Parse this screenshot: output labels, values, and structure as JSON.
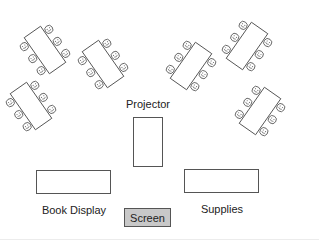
{
  "colors": {
    "stroke": "#555555",
    "screen_fill": "#c8c8c8",
    "background": "#ffffff",
    "text": "#222222"
  },
  "tables": [
    {
      "id": "table-1",
      "cx": 45,
      "cy": 50,
      "w": 20,
      "h": 44,
      "angle": -35,
      "seats_per_side": 3,
      "seats_total": 6
    },
    {
      "id": "table-2",
      "cx": 103,
      "cy": 64,
      "w": 20,
      "h": 44,
      "angle": -35,
      "seats_per_side": 3,
      "seats_total": 6
    },
    {
      "id": "table-3",
      "cx": 31,
      "cy": 106,
      "w": 20,
      "h": 44,
      "angle": -35,
      "seats_per_side": 3,
      "seats_total": 6
    },
    {
      "id": "table-4",
      "cx": 191,
      "cy": 66,
      "w": 20,
      "h": 44,
      "angle": 35,
      "seats_per_side": 3,
      "seats_total": 6
    },
    {
      "id": "table-5",
      "cx": 247,
      "cy": 46,
      "w": 20,
      "h": 44,
      "angle": 35,
      "seats_per_side": 3,
      "seats_total": 6
    },
    {
      "id": "table-6",
      "cx": 260,
      "cy": 111,
      "w": 20,
      "h": 44,
      "angle": 35,
      "seats_per_side": 3,
      "seats_total": 6
    }
  ],
  "seat_icon": "smiley-face-icon",
  "projector": {
    "label": "Projector",
    "x": 133,
    "y": 117,
    "w": 30,
    "h": 50,
    "label_x": 148,
    "label_y": 99
  },
  "book_display": {
    "label": "Book Display",
    "x": 36,
    "y": 170,
    "w": 75,
    "h": 24,
    "label_x": 74,
    "label_y": 205
  },
  "supplies": {
    "label": "Supplies",
    "x": 184,
    "y": 169,
    "w": 75,
    "h": 24,
    "label_x": 222,
    "label_y": 204
  },
  "screen": {
    "label": "Screen",
    "x": 124,
    "y": 208,
    "w": 47,
    "h": 19
  }
}
